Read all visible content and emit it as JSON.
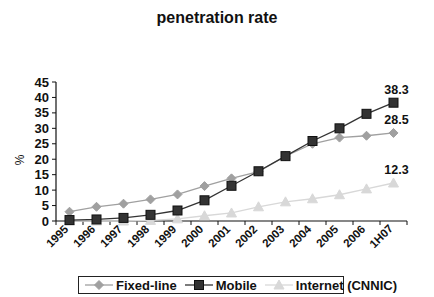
{
  "chart_data": {
    "type": "line",
    "title": "penetration rate",
    "xlabel": "",
    "ylabel": "%",
    "ylim": [
      0,
      45
    ],
    "yticks": [
      0,
      5,
      10,
      15,
      20,
      25,
      30,
      35,
      40,
      45
    ],
    "categories": [
      "1995",
      "1996",
      "1997",
      "1998",
      "1999",
      "2000",
      "2001",
      "2002",
      "2003",
      "2004",
      "2005",
      "2006",
      "1H07"
    ],
    "grid": false,
    "legend_position": "bottom",
    "series": [
      {
        "name": "Fixed-line",
        "color": "#a0a0a0",
        "marker": "diamond",
        "values": [
          3.0,
          4.6,
          5.6,
          7.0,
          8.6,
          11.3,
          13.8,
          16.0,
          21.0,
          25.0,
          27.0,
          27.6,
          28.5
        ],
        "end_label": "28.5"
      },
      {
        "name": "Mobile",
        "color": "#333333",
        "marker": "square",
        "values": [
          0.3,
          0.5,
          1.0,
          2.0,
          3.4,
          6.7,
          11.4,
          16.1,
          21.0,
          25.9,
          30.0,
          34.7,
          38.3
        ],
        "end_label": "38.3"
      },
      {
        "name": "Internet (CNNIC)",
        "color": "#d8d8d8",
        "marker": "triangle",
        "values": [
          0.0,
          0.0,
          0.0,
          0.2,
          0.7,
          1.7,
          2.6,
          4.6,
          6.2,
          7.2,
          8.5,
          10.4,
          12.3
        ],
        "end_label": "12.3"
      }
    ]
  }
}
